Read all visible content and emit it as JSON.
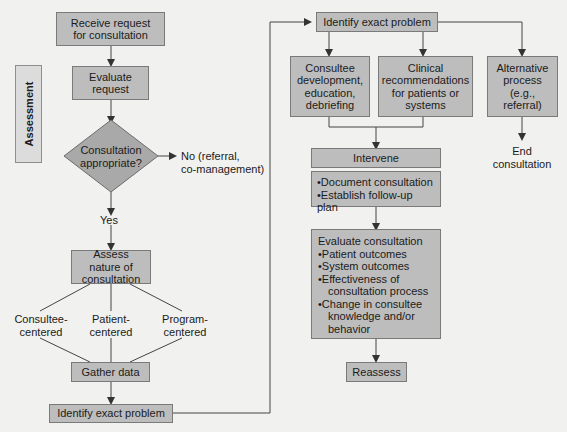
{
  "diagram": {
    "assessment_label": "Assessment",
    "left": {
      "receive": "Receive request for  consultation",
      "evaluate": "Evaluate request",
      "decision": "Consultation appropriate?",
      "no_branch": "No (referral,\nco-management)",
      "yes_branch": "Yes",
      "assess": "Assess nature of consultation",
      "types": [
        "Consultee-\ncentered",
        "Patient-\ncentered",
        "Program-\ncentered"
      ],
      "gather": "Gather data",
      "identify": "Identify exact problem"
    },
    "right": {
      "identify": "Identify exact problem",
      "branches": [
        "Consultee development, education, debriefing",
        "Clinical recommendations for patients or systems",
        "Alternative process (e.g., referral)"
      ],
      "end": "End consultation",
      "intervene": "Intervene",
      "intervene_items": [
        "•Document consultation",
        "•Establish follow-up plan"
      ],
      "evaluate_title": "Evaluate consultation",
      "evaluate_items": [
        "•Patient outcomes",
        "•System outcomes",
        "•Effectiveness of",
        "consultation process",
        "•Change in consultee",
        "knowledge and/or",
        "behavior"
      ],
      "reassess": "Reassess"
    }
  }
}
